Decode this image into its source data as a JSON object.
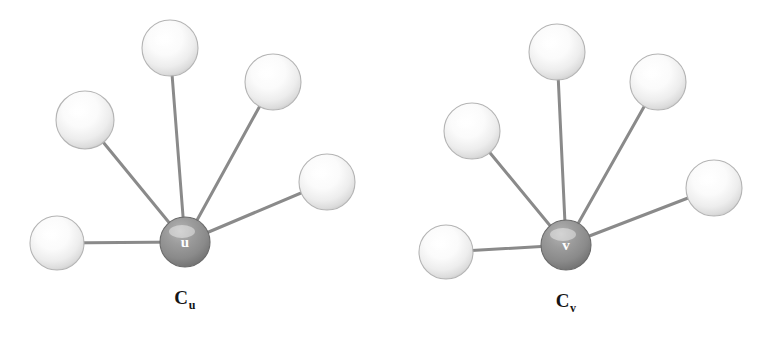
{
  "figure": {
    "background_color": "#ffffff",
    "width": 768,
    "height": 341,
    "bond_color": "#8a8a8a",
    "bond_width": 3,
    "center_atom_fill": "#8c8c8c",
    "center_atom_edge": "#6a6a6a",
    "center_atom_label_color": "#ffffff",
    "outer_atom_fill": "#fdfdfd",
    "outer_atom_edge": "#b4b4b4"
  },
  "clusters": [
    {
      "id": "cluster-u",
      "caption_base": "C",
      "caption_sub": "u",
      "caption_x": 185,
      "caption_y": 287,
      "center": {
        "label": "u",
        "x": 185,
        "y": 242,
        "r": 25
      },
      "neighbors": [
        {
          "name": "neighbor-left",
          "x": 57,
          "y": 243,
          "r": 27
        },
        {
          "name": "neighbor-upper-left",
          "x": 85,
          "y": 120,
          "r": 29
        },
        {
          "name": "neighbor-top",
          "x": 170,
          "y": 48,
          "r": 28
        },
        {
          "name": "neighbor-upper-right",
          "x": 273,
          "y": 82,
          "r": 28
        },
        {
          "name": "neighbor-right",
          "x": 327,
          "y": 182,
          "r": 28
        }
      ]
    },
    {
      "id": "cluster-v",
      "caption_base": "C",
      "caption_sub": "v",
      "caption_x": 566,
      "caption_y": 290,
      "center": {
        "label": "v",
        "x": 566,
        "y": 245,
        "r": 25
      },
      "neighbors": [
        {
          "name": "neighbor-left",
          "x": 446,
          "y": 252,
          "r": 27
        },
        {
          "name": "neighbor-upper-left",
          "x": 472,
          "y": 131,
          "r": 28
        },
        {
          "name": "neighbor-top",
          "x": 557,
          "y": 52,
          "r": 28
        },
        {
          "name": "neighbor-upper-right",
          "x": 658,
          "y": 82,
          "r": 28
        },
        {
          "name": "neighbor-right",
          "x": 714,
          "y": 188,
          "r": 28
        }
      ]
    }
  ]
}
